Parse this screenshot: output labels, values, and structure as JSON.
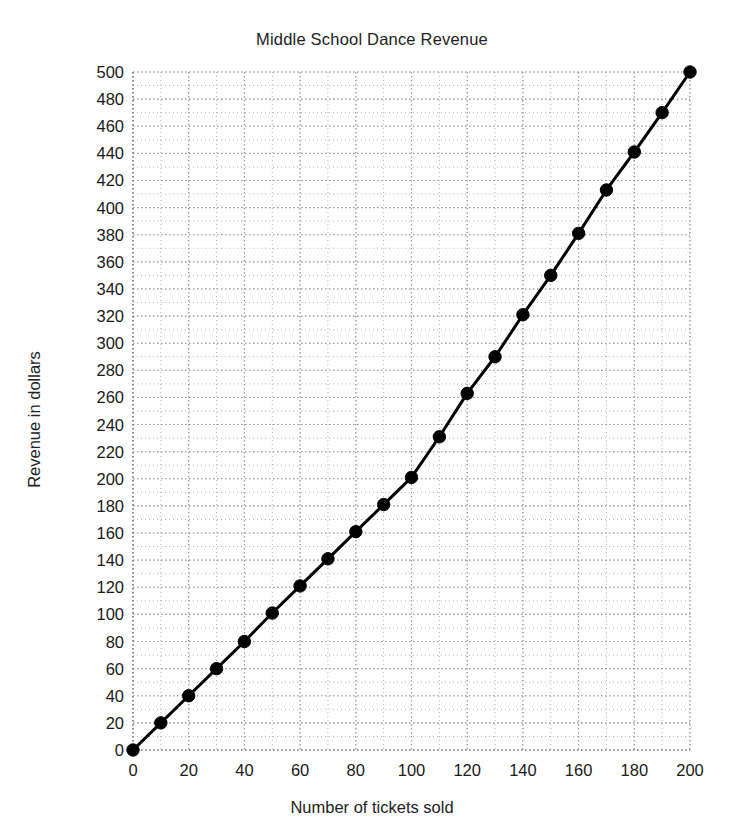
{
  "chart_data": {
    "type": "line",
    "title": "Middle School Dance Revenue",
    "xlabel": "Number of tickets sold",
    "ylabel": "Revenue in dollars",
    "xlim": [
      0,
      200
    ],
    "ylim": [
      0,
      500
    ],
    "xticks": [
      0,
      20,
      40,
      60,
      80,
      100,
      120,
      140,
      160,
      180,
      200
    ],
    "yticks": [
      0,
      20,
      40,
      60,
      80,
      100,
      120,
      140,
      160,
      180,
      200,
      220,
      240,
      260,
      280,
      300,
      320,
      340,
      360,
      380,
      400,
      420,
      440,
      460,
      480,
      500
    ],
    "x_minor_step": 10,
    "y_minor_step": 10,
    "grid": true,
    "grid_style": "dotted",
    "grid_color": "#999999",
    "legend": null,
    "series": [
      {
        "name": "Revenue",
        "line_color": "#000000",
        "marker": "circle",
        "marker_color": "#000000",
        "x": [
          0,
          10,
          20,
          30,
          40,
          50,
          60,
          70,
          80,
          90,
          100,
          110,
          120,
          130,
          140,
          150,
          160,
          170,
          180,
          190,
          200
        ],
        "values": [
          0,
          20,
          40,
          60,
          80,
          101,
          121,
          141,
          161,
          181,
          201,
          231,
          263,
          290,
          321,
          350,
          381,
          413,
          441,
          470,
          500
        ]
      }
    ]
  }
}
